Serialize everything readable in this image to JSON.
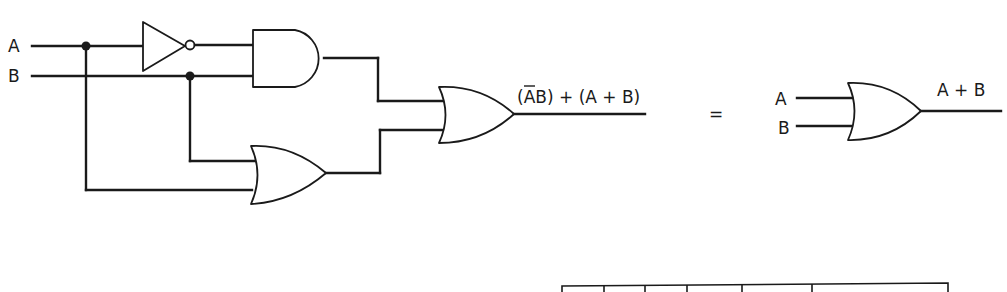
{
  "diagram": {
    "type": "logic-circuit",
    "left_circuit": {
      "inputs": [
        {
          "label": "A"
        },
        {
          "label": "B"
        }
      ],
      "gates": [
        {
          "id": "not1",
          "kind": "NOT",
          "input": "A",
          "output": "Ā"
        },
        {
          "id": "and1",
          "kind": "AND",
          "inputs": [
            "Ā",
            "B"
          ],
          "output": "ĀB"
        },
        {
          "id": "or1",
          "kind": "OR",
          "inputs": [
            "B",
            "A"
          ],
          "output": "A + B"
        },
        {
          "id": "or2",
          "kind": "OR",
          "inputs": [
            "ĀB",
            "A + B"
          ],
          "output": "(ĀB) + (A + B)"
        }
      ],
      "output_label_parts": {
        "open_paren": "(",
        "a_bar": "A",
        "rest": "B) + (A + B)"
      }
    },
    "equals_sign": "=",
    "right_circuit": {
      "inputs": [
        {
          "label": "A"
        },
        {
          "label": "B"
        }
      ],
      "gates": [
        {
          "id": "or3",
          "kind": "OR",
          "inputs": [
            "A",
            "B"
          ],
          "output": "A + B"
        }
      ],
      "output_label": "A + B"
    },
    "table_fragment": {
      "columns_visible": 6
    },
    "colors": {
      "ink": "#1a1a1a",
      "background": "#ffffff"
    }
  }
}
